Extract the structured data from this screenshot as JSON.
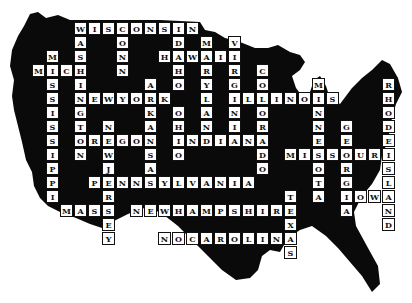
{
  "puzzle": {
    "title": "US States Crossword",
    "origin": {
      "x": 74,
      "y": 22
    },
    "cell_size": 14,
    "silhouette_color": "#0a0a0a",
    "words": [
      {
        "word": "WISCONSIN",
        "dir": "across",
        "row": 0,
        "col": 0
      },
      {
        "word": "WASHINGTON",
        "dir": "down",
        "row": 0,
        "col": 0
      },
      {
        "word": "CONN",
        "dir": "down",
        "row": 0,
        "col": 3
      },
      {
        "word": "IDAHO",
        "dir": "down",
        "row": 0,
        "col": 7
      },
      {
        "word": "HAWAII",
        "dir": "across",
        "row": 2,
        "col": 6
      },
      {
        "word": "MARYLAND",
        "dir": "down",
        "row": 1,
        "col": 9
      },
      {
        "word": "VIRGINIA",
        "dir": "down",
        "row": 1,
        "col": 11
      },
      {
        "word": "MISSISSIPPI",
        "dir": "down",
        "row": 2,
        "col": -2
      },
      {
        "word": "MICH",
        "dir": "across",
        "row": 3,
        "col": -3
      },
      {
        "word": "COLORADO",
        "dir": "down",
        "row": 3,
        "col": 13
      },
      {
        "word": "ARKANSAS",
        "dir": "down",
        "row": 4,
        "col": 5
      },
      {
        "word": "NEWYORK",
        "dir": "across",
        "row": 5,
        "col": 0
      },
      {
        "word": "ILLINOIS",
        "dir": "across",
        "row": 5,
        "col": 11
      },
      {
        "word": "MINNESOTA",
        "dir": "down",
        "row": 4,
        "col": 17
      },
      {
        "word": "RHODEISLAND",
        "dir": "down",
        "row": 4,
        "col": 22
      },
      {
        "word": "OHIO",
        "dir": "down",
        "row": 6,
        "col": 7
      },
      {
        "word": "NEWJERSEY",
        "dir": "down",
        "row": 7,
        "col": 2
      },
      {
        "word": "GEORGIA",
        "dir": "down",
        "row": 7,
        "col": 19
      },
      {
        "word": "OREGON",
        "dir": "across",
        "row": 8,
        "col": 0
      },
      {
        "word": "INDIANA",
        "dir": "across",
        "row": 8,
        "col": 7
      },
      {
        "word": "MISSOURI",
        "dir": "across",
        "row": 9,
        "col": 15
      },
      {
        "word": "PENNSYLVANIA",
        "dir": "across",
        "row": 11,
        "col": 1
      },
      {
        "word": "TEXAS",
        "dir": "down",
        "row": 12,
        "col": 15
      },
      {
        "word": "IOWA",
        "dir": "across",
        "row": 12,
        "col": 19
      },
      {
        "word": "MASS",
        "dir": "across",
        "row": 13,
        "col": -1
      },
      {
        "word": "NEWHAMPSHIRE",
        "dir": "across",
        "row": 13,
        "col": 4
      },
      {
        "word": "NOCAROLINA",
        "dir": "across",
        "row": 15,
        "col": 6
      }
    ]
  }
}
